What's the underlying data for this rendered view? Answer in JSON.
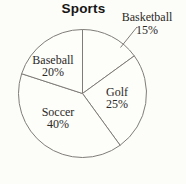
{
  "chart_data": {
    "type": "pie",
    "title": "Sports",
    "direction": "clockwise",
    "start_angle_deg_from_top": 0,
    "legend": "none",
    "fill_color": "#fdfdfa",
    "stroke_color": "#807d78",
    "text_color": "#2b2926",
    "slices": [
      {
        "label": "Basketball",
        "value": 15,
        "pct_label": "15%",
        "label_placement": "outside-with-leader-line"
      },
      {
        "label": "Golf",
        "value": 25,
        "pct_label": "25%",
        "label_placement": "inside"
      },
      {
        "label": "Soccer",
        "value": 40,
        "pct_label": "40%",
        "label_placement": "inside"
      },
      {
        "label": "Baseball",
        "value": 20,
        "pct_label": "20%",
        "label_placement": "inside"
      }
    ]
  }
}
